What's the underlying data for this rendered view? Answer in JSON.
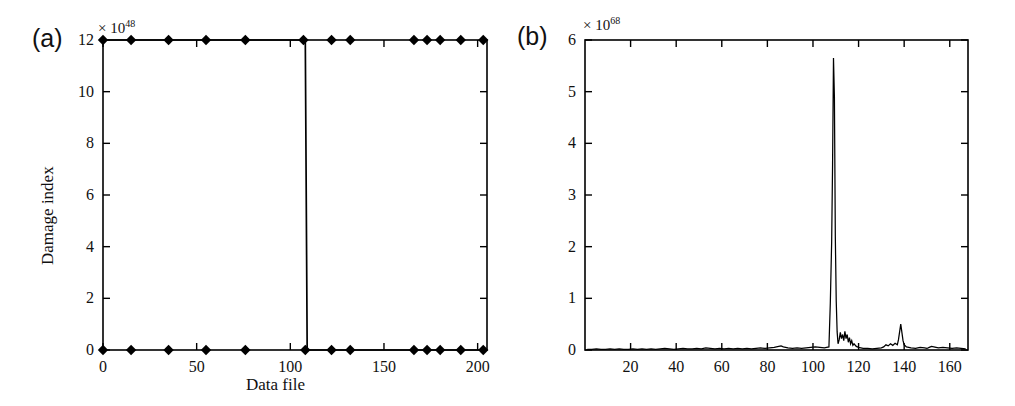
{
  "figure": {
    "background": "#ffffff",
    "line_color": "#000000",
    "panels": [
      "a",
      "b"
    ]
  },
  "panel_a": {
    "tag": "(a)",
    "exponent_prefix": "× 10",
    "exponent_power": "48"
  },
  "panel_b": {
    "tag": "(b)",
    "exponent_prefix": "× 10",
    "exponent_power": "68"
  },
  "chart_data": [
    {
      "type": "line",
      "panel": "a",
      "title": "",
      "xlabel": "Data file",
      "ylabel": "Damage index",
      "y_exponent_label": "× 10^48",
      "y_scale_factor": 1e+48,
      "xlim": [
        0,
        205
      ],
      "ylim": [
        0,
        12
      ],
      "xticks": [
        0,
        50,
        100,
        150,
        200
      ],
      "xtick_labels": [
        "0",
        "50",
        "100",
        "150",
        "200"
      ],
      "yticks": [
        0,
        2,
        4,
        6,
        8,
        10,
        12
      ],
      "ytick_labels": [
        "0",
        "2",
        "4",
        "6",
        "8",
        "10",
        "12"
      ],
      "grid": false,
      "legend": "none",
      "marker": "diamond",
      "series": [
        {
          "name": "Damage index (upper branch)",
          "comment": "step function: saturated at 12 before the transition, 0 after",
          "x": [
            0,
            15,
            35,
            55,
            76,
            107,
            108,
            109,
            110,
            122,
            132,
            166,
            173,
            180,
            191,
            203
          ],
          "y": [
            12,
            12,
            12,
            12,
            12,
            12,
            12,
            0,
            0,
            0,
            0,
            0,
            0,
            0,
            0,
            0
          ]
        }
      ],
      "marker_points_top": [
        {
          "x": 0,
          "y": 12
        },
        {
          "x": 15,
          "y": 12
        },
        {
          "x": 35,
          "y": 12
        },
        {
          "x": 55,
          "y": 12
        },
        {
          "x": 76,
          "y": 12
        },
        {
          "x": 107,
          "y": 12
        },
        {
          "x": 122,
          "y": 12
        },
        {
          "x": 132,
          "y": 12
        },
        {
          "x": 166,
          "y": 12
        },
        {
          "x": 173,
          "y": 12
        },
        {
          "x": 180,
          "y": 12
        },
        {
          "x": 191,
          "y": 12
        },
        {
          "x": 203,
          "y": 12
        }
      ],
      "marker_points_bottom": [
        {
          "x": 0,
          "y": 0
        },
        {
          "x": 15,
          "y": 0
        },
        {
          "x": 35,
          "y": 0
        },
        {
          "x": 55,
          "y": 0
        },
        {
          "x": 76,
          "y": 0
        },
        {
          "x": 108,
          "y": 0
        },
        {
          "x": 122,
          "y": 0
        },
        {
          "x": 132,
          "y": 0
        },
        {
          "x": 166,
          "y": 0
        },
        {
          "x": 173,
          "y": 0
        },
        {
          "x": 180,
          "y": 0
        },
        {
          "x": 191,
          "y": 0
        },
        {
          "x": 203,
          "y": 0
        }
      ],
      "transition_x": 108
    },
    {
      "type": "line",
      "panel": "b",
      "title": "",
      "xlabel": "",
      "ylabel": "",
      "y_exponent_label": "× 10^68",
      "y_scale_factor": 1e+68,
      "xlim": [
        0,
        168
      ],
      "ylim": [
        0,
        6
      ],
      "xticks": [
        20,
        40,
        60,
        80,
        100,
        120,
        140,
        160
      ],
      "xtick_labels": [
        "20",
        "40",
        "60",
        "80",
        "100",
        "120",
        "140",
        "160"
      ],
      "yticks": [
        0,
        1,
        2,
        3,
        4,
        5,
        6
      ],
      "ytick_labels": [
        "0",
        "1",
        "2",
        "3",
        "4",
        "5",
        "6"
      ],
      "grid": false,
      "legend": "none",
      "marker": "none",
      "peak_main": {
        "x": 109,
        "y": 5.65
      },
      "peak_secondary": {
        "x": 138,
        "y": 0.5
      },
      "series": [
        {
          "name": "Damage index",
          "x": [
            1,
            3,
            5,
            7,
            9,
            11,
            13,
            15,
            17,
            19,
            21,
            23,
            25,
            27,
            29,
            31,
            33,
            35,
            37,
            39,
            41,
            43,
            45,
            47,
            49,
            51,
            53,
            55,
            57,
            59,
            61,
            63,
            65,
            67,
            69,
            71,
            73,
            75,
            77,
            79,
            81,
            83,
            85,
            86,
            87,
            89,
            91,
            93,
            95,
            97,
            99,
            101,
            103,
            105,
            106,
            107,
            107.6,
            108.2,
            108.6,
            109,
            109.4,
            109.8,
            110.2,
            110.6,
            111,
            111.5,
            112,
            112.5,
            113,
            113.5,
            114,
            114.5,
            115,
            115.5,
            116,
            116.5,
            117,
            117.5,
            118,
            119,
            120,
            121,
            122,
            124,
            126,
            128,
            130,
            131,
            132,
            133,
            134,
            135,
            136,
            137,
            137.5,
            138,
            138.5,
            139,
            139.5,
            140,
            141,
            142,
            143,
            145,
            147,
            149,
            150,
            151,
            152,
            153,
            155,
            157,
            159,
            161,
            163,
            165,
            167
          ],
          "y": [
            0.01,
            0.01,
            0.02,
            0.01,
            0.01,
            0.02,
            0.01,
            0.02,
            0.01,
            0.01,
            0.02,
            0.01,
            0.02,
            0.01,
            0.02,
            0.01,
            0.02,
            0.03,
            0.02,
            0.01,
            0.02,
            0.03,
            0.02,
            0.02,
            0.03,
            0.02,
            0.04,
            0.03,
            0.02,
            0.03,
            0.02,
            0.03,
            0.02,
            0.03,
            0.02,
            0.03,
            0.02,
            0.03,
            0.04,
            0.03,
            0.04,
            0.05,
            0.07,
            0.08,
            0.06,
            0.04,
            0.03,
            0.04,
            0.03,
            0.04,
            0.05,
            0.06,
            0.05,
            0.04,
            0.05,
            0.06,
            0.9,
            2.1,
            3.6,
            5.65,
            4.9,
            2.2,
            0.95,
            0.35,
            0.12,
            0.2,
            0.34,
            0.22,
            0.3,
            0.18,
            0.36,
            0.22,
            0.3,
            0.15,
            0.24,
            0.12,
            0.18,
            0.09,
            0.12,
            0.07,
            0.05,
            0.04,
            0.03,
            0.03,
            0.02,
            0.03,
            0.04,
            0.06,
            0.1,
            0.08,
            0.12,
            0.09,
            0.13,
            0.1,
            0.2,
            0.35,
            0.5,
            0.34,
            0.18,
            0.1,
            0.06,
            0.05,
            0.04,
            0.03,
            0.05,
            0.04,
            0.03,
            0.05,
            0.07,
            0.06,
            0.04,
            0.05,
            0.04,
            0.03,
            0.04,
            0.03,
            0.02,
            0.03
          ]
        }
      ]
    }
  ]
}
